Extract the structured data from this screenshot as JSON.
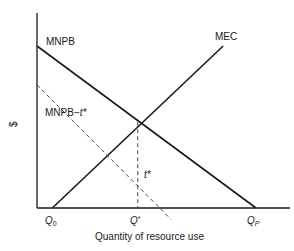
{
  "chart_data": {
    "type": "line",
    "title": "",
    "xlabel": "Quantity of resource use",
    "ylabel": "$",
    "series": [
      {
        "name": "MNPB",
        "style": "solid",
        "points": [
          [
            0,
            1.0
          ],
          [
            1.0,
            0
          ]
        ]
      },
      {
        "name": "MEC",
        "style": "solid",
        "points": [
          [
            0.07,
            0
          ],
          [
            0.85,
            1.0
          ]
        ]
      },
      {
        "name": "MNPB−t*",
        "style": "dashed",
        "points": [
          [
            0,
            0.76
          ],
          [
            0.56,
            0
          ]
        ]
      }
    ],
    "guides": [
      {
        "name": "t*",
        "style": "dashed",
        "x": 0.46,
        "y_range": [
          0,
          0.53
        ]
      }
    ],
    "x_ticks": [
      {
        "label": "Q",
        "sub": "0",
        "x": 0.07
      },
      {
        "label": "Q",
        "sup": "*",
        "x": 0.46
      },
      {
        "label": "Q",
        "sub": "P",
        "x": 1.0
      }
    ],
    "annotations": [
      {
        "text": "MNPB",
        "near": "MNPB-start"
      },
      {
        "text": "MEC",
        "near": "MEC-end"
      },
      {
        "text": "MNPB−t*",
        "near": "MNPB-t-start"
      },
      {
        "text": "t*",
        "near": "vertical-guide"
      }
    ]
  },
  "labels": {
    "y_axis": "$",
    "x_axis": "Quantity of resource use",
    "mnpb": "MNPB",
    "mec": "MEC",
    "mnpb_t_base": "MNPB−",
    "mnpb_t_var": "t*",
    "t_star": "t*",
    "q0_main": "Q",
    "q0_sub": "0",
    "qstar_main": "Q",
    "qstar_sup": "*",
    "qp_main": "Q",
    "qp_sub": "P"
  }
}
